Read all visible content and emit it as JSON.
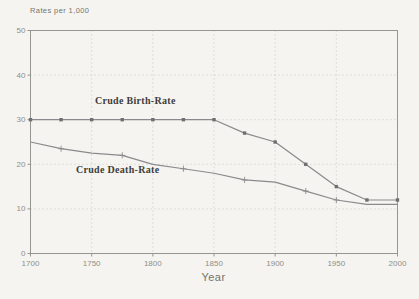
{
  "chart_data": {
    "type": "line",
    "title": "",
    "xlabel": "Year",
    "ylabel": "Rates per 1,000",
    "x": [
      1700,
      1725,
      1750,
      1775,
      1800,
      1825,
      1850,
      1875,
      1900,
      1925,
      1950,
      1975,
      2000
    ],
    "series": [
      {
        "name": "Crude Birth-Rate",
        "marker": "square",
        "values": [
          30,
          30,
          30,
          30,
          30,
          30,
          30,
          27,
          25,
          20,
          15,
          12,
          12
        ]
      },
      {
        "name": "Crude Death-Rate",
        "marker": "plus",
        "marker_years": [
          1725,
          1775,
          1825,
          1875,
          1925,
          1950
        ],
        "values": [
          25,
          23.5,
          22.5,
          22,
          20,
          19,
          18,
          16.5,
          16,
          14,
          12,
          11,
          11
        ]
      }
    ],
    "xlim": [
      1700,
      2000
    ],
    "ylim": [
      0,
      50
    ],
    "xticks": [
      1700,
      1750,
      1800,
      1850,
      1900,
      1950,
      2000
    ],
    "yticks": [
      0,
      10,
      20,
      30,
      40,
      50
    ],
    "grid": "dotted",
    "legend_position": "inline-labels",
    "colors": {
      "background": "#f5f4f0",
      "frame": "#969690",
      "grid": "#c8c8c2",
      "line": "#8a8a8c",
      "marker": "#6f6f72",
      "tick_text": "#8f8f89",
      "label_text": "#3d3d3a"
    }
  }
}
